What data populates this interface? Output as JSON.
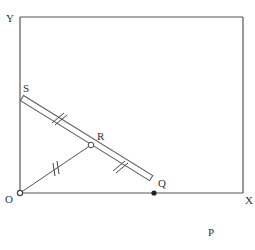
{
  "diagram": {
    "type": "geometry",
    "colors": {
      "stroke": "#555555",
      "label": "#333333",
      "background": "#ffffff"
    },
    "points": {
      "Y": {
        "label": "Y",
        "x": 20,
        "y": 17
      },
      "O": {
        "label": "O",
        "x": 20,
        "y": 193
      },
      "X": {
        "label": "X",
        "x": 243,
        "y": 193
      },
      "S": {
        "label": "S",
        "x": 22,
        "y": 98
      },
      "R": {
        "label": "R",
        "x": 91,
        "y": 145
      },
      "Q": {
        "label": "Q",
        "x": 154,
        "y": 193
      },
      "P": {
        "label": "P",
        "x": 206,
        "y": 226
      }
    },
    "labels": {
      "Y": "Y",
      "O": "O",
      "X": "X",
      "S": "S",
      "R": "R",
      "Q": "Q",
      "P": "P"
    },
    "equal_marks": [
      {
        "segment": "SR",
        "ticks": 2
      },
      {
        "segment": "RQ",
        "ticks": 2
      },
      {
        "segment": "OR",
        "ticks": 2
      }
    ]
  }
}
